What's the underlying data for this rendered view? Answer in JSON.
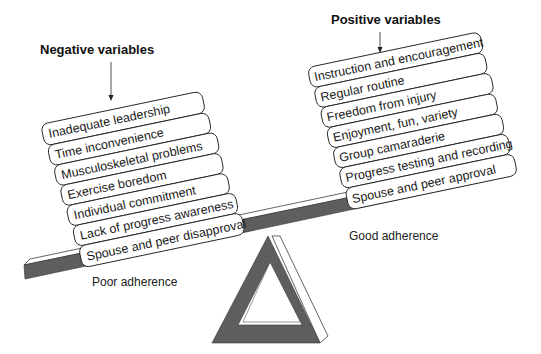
{
  "diagram": {
    "type": "seesaw-balance",
    "colors": {
      "beam": "#5e5e5e",
      "fulcrum": "#5e5e5e",
      "outline": "#222222",
      "background": "#ffffff"
    },
    "negative": {
      "heading": "Negative variables",
      "items": [
        "Inadequate leadership",
        "Time inconvenience",
        "Musculoskeletal problems",
        "Exercise boredom",
        "Individual commitment",
        "Lack of progress awareness",
        "Spouse and peer disapproval"
      ],
      "outcome": "Poor adherence"
    },
    "positive": {
      "heading": "Positive variables",
      "items": [
        "Instruction and encouragement",
        "Regular routine",
        "Freedom from injury",
        "Enjoyment, fun, variety",
        "Group camaraderie",
        "Progress testing and recording",
        "Spouse and peer approval"
      ],
      "outcome": "Good adherence"
    }
  }
}
